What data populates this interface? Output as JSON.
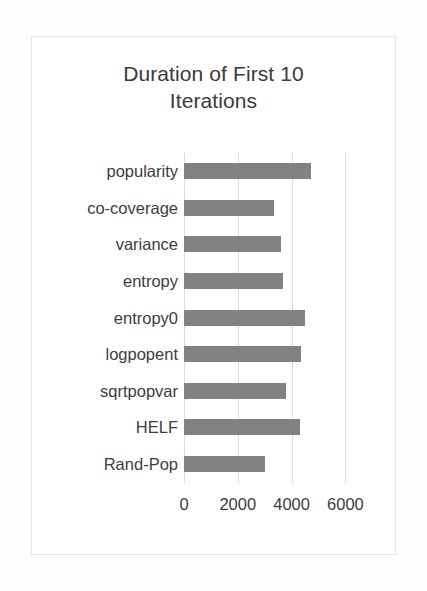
{
  "chart_data": {
    "type": "bar",
    "orientation": "horizontal",
    "title": "Duration of First 10 Iterations",
    "title_lines": [
      "Duration of First 10",
      "Iterations"
    ],
    "categories": [
      "popularity",
      "co-coverage",
      "variance",
      "entropy",
      "entropy0",
      "logpopent",
      "sqrtpopvar",
      "HELF",
      "Rand-Pop"
    ],
    "values": [
      4730,
      3345,
      3620,
      3680,
      4510,
      4360,
      3780,
      4325,
      3000
    ],
    "xlabel": "",
    "ylabel": "",
    "xlim": [
      0,
      6800
    ],
    "xticks": [
      0,
      2000,
      4000,
      6000
    ],
    "xtick_labels": [
      "0",
      "2000",
      "4000",
      "6000"
    ],
    "grid": "vertical",
    "legend": "none",
    "bar_color": "#828282",
    "gridline_color": "#dcdcdc",
    "background_color": "#ffffff",
    "text_color": "#3d3d3d"
  }
}
